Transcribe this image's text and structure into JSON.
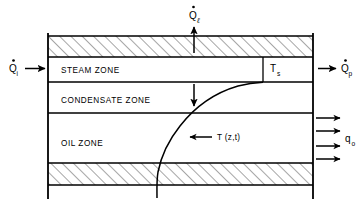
{
  "figure": {
    "type": "cross-section-diagram",
    "background_color": "#ffffff",
    "line_color": "#000000"
  },
  "zones": [
    {
      "id": "overburden",
      "label": "",
      "fill": "hatched",
      "top": 35,
      "bottom": 57
    },
    {
      "id": "steam",
      "label": "STEAM ZONE",
      "fill": "white",
      "top": 57,
      "bottom": 82
    },
    {
      "id": "condensate",
      "label": "CONDENSATE ZONE",
      "fill": "white",
      "top": 82,
      "bottom": 113
    },
    {
      "id": "oil",
      "label": "OIL ZONE",
      "fill": "white",
      "top": 113,
      "bottom": 163
    },
    {
      "id": "underburden",
      "label": "",
      "fill": "hatched",
      "top": 163,
      "bottom": 186
    }
  ],
  "labels": {
    "steam_zone": "STEAM ZONE",
    "condensate_zone": "CONDENSATE ZONE",
    "oil_zone": "OIL ZONE",
    "steam_temperature": "T",
    "steam_temperature_sub": "s",
    "temperature_profile": "T (z,t)"
  },
  "flows": [
    {
      "id": "heat-injected",
      "symbol": "Q",
      "subscript": "i",
      "overdot": true,
      "direction": "right",
      "position": "left-outside",
      "description": "Heat injection rate into steam zone"
    },
    {
      "id": "heat-produced",
      "symbol": "Q",
      "subscript": "p",
      "overdot": true,
      "direction": "right",
      "position": "right-outside",
      "description": "Heat production rate out of steam zone"
    },
    {
      "id": "heat-loss-overburden",
      "symbol": "Q",
      "subscript": "ℓ",
      "overdot": true,
      "direction": "up",
      "position": "top-center",
      "description": "Heat loss rate to overburden"
    },
    {
      "id": "oil-rate",
      "symbol": "q",
      "subscript": "o",
      "overdot": false,
      "direction": "right",
      "position": "right-oil-zone",
      "arrow_count": 4,
      "description": "Oil production flux from oil zone"
    },
    {
      "id": "downward-conduction",
      "symbol": "",
      "subscript": "",
      "overdot": false,
      "direction": "down",
      "position": "condensate-zone",
      "description": "Downward heat conduction arrow"
    }
  ],
  "curve": {
    "name": "temperature-profile-curve",
    "label": "T (z,t)",
    "description": "Temperature profile versus depth, asymptotic to steam temperature at the steam/condensate interface"
  }
}
